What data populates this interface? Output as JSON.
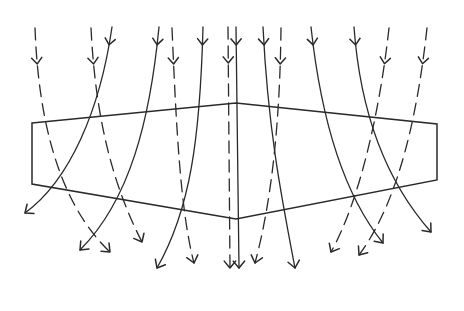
{
  "diagram": {
    "title": "",
    "colors": {
      "stroke": "#2a2a2a",
      "background": "#ffffff"
    },
    "slab": {
      "top": [
        [
          32,
          123
        ],
        [
          236,
          103
        ],
        [
          437,
          124
        ]
      ],
      "bottom": [
        [
          32,
          184
        ],
        [
          236,
          219
        ],
        [
          437,
          180
        ]
      ]
    },
    "rays": [
      {
        "style": "dashed",
        "path": "M35,28 C38,110 55,200 110,252",
        "end": [
          110,
          252
        ],
        "mid": [
          37,
          62
        ]
      },
      {
        "style": "dashed",
        "path": "M91,28 C95,110 110,180 142,242",
        "end": [
          142,
          242
        ],
        "mid": [
          93,
          62
        ]
      },
      {
        "style": "solid",
        "path": "M112,27 C100,110 70,180 25,213",
        "end": [
          25,
          213
        ],
        "mid": [
          110,
          44
        ]
      },
      {
        "style": "solid",
        "path": "M159,27 C150,120 130,200 80,250",
        "end": [
          80,
          250
        ],
        "mid": [
          157,
          44
        ]
      },
      {
        "style": "dashed",
        "path": "M172,28 C176,120 180,210 194,263",
        "end": [
          194,
          263
        ],
        "mid": [
          173,
          64
        ]
      },
      {
        "style": "solid",
        "path": "M203,27 C200,140 190,210 157,268",
        "end": [
          157,
          268
        ],
        "mid": [
          202,
          44
        ]
      },
      {
        "style": "dashed",
        "path": "M228,27 L230,268",
        "end": [
          230,
          268
        ],
        "mid": [
          228,
          64
        ]
      },
      {
        "style": "solid",
        "path": "M236,27 L239,268",
        "end": [
          239,
          268
        ],
        "mid": [
          236,
          44
        ]
      },
      {
        "style": "dashed",
        "path": "M281,28 C280,120 272,200 255,263",
        "end": [
          255,
          263
        ],
        "mid": [
          280,
          64
        ]
      },
      {
        "style": "solid",
        "path": "M263,27 C268,130 282,200 295,268",
        "end": [
          295,
          268
        ],
        "mid": [
          264,
          44
        ]
      },
      {
        "style": "solid",
        "path": "M311,27 C320,110 340,190 383,243",
        "end": [
          383,
          243
        ],
        "mid": [
          312,
          44
        ]
      },
      {
        "style": "dashed",
        "path": "M389,28 C380,110 360,200 331,252",
        "end": [
          331,
          252
        ],
        "mid": [
          386,
          64
        ]
      },
      {
        "style": "solid",
        "path": "M354,27 C360,110 385,180 431,232",
        "end": [
          431,
          232
        ],
        "mid": [
          356,
          44
        ]
      },
      {
        "style": "dashed",
        "path": "M427,28 C418,110 400,200 359,255",
        "end": [
          359,
          255
        ],
        "mid": [
          424,
          64
        ]
      }
    ]
  }
}
